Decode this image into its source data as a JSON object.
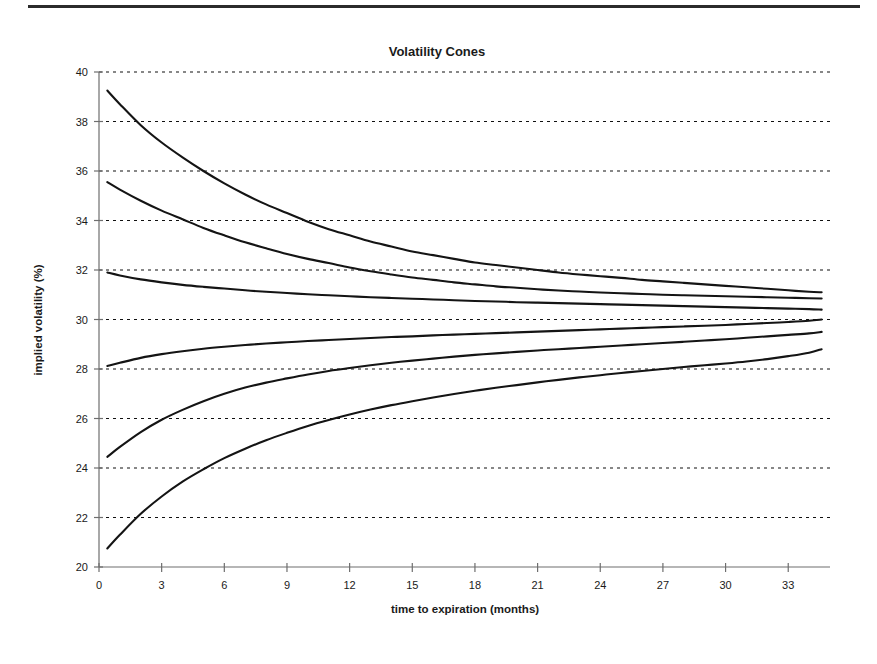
{
  "figure": {
    "title": "Volatility Cones",
    "top_rule": true
  },
  "chart_data": {
    "type": "line",
    "title": "Volatility Cones",
    "xlabel": "time to expiration (months)",
    "ylabel": "implied volatility (%)",
    "xlim": [
      0,
      35
    ],
    "ylim": [
      20,
      40
    ],
    "xticks": [
      0,
      3,
      6,
      9,
      12,
      15,
      18,
      21,
      24,
      27,
      30,
      33
    ],
    "xtick_labels": [
      "0",
      "3",
      "6",
      "9",
      "12",
      "15",
      "18",
      "21",
      "24",
      "27",
      "30",
      "33"
    ],
    "yticks": [
      20,
      22,
      24,
      26,
      28,
      30,
      32,
      34,
      36,
      38,
      40
    ],
    "ytick_labels": [
      "20",
      "22",
      "24",
      "26",
      "28",
      "30",
      "32",
      "34",
      "36",
      "38",
      "40"
    ],
    "grid": "horizontal-dotted",
    "legend": "none",
    "line_color": "#141414",
    "x": [
      0.4,
      1,
      2,
      3,
      4,
      5,
      6,
      7,
      8,
      9,
      10,
      11,
      12,
      13,
      14,
      15,
      16,
      17,
      18,
      19,
      20,
      21,
      22,
      23,
      24,
      25,
      26,
      27,
      28,
      29,
      30,
      31,
      32,
      33,
      34,
      34.6
    ],
    "series": [
      {
        "name": "upper outer band",
        "values": [
          39.25,
          38.7,
          37.85,
          37.15,
          36.55,
          36.0,
          35.5,
          35.05,
          34.65,
          34.3,
          33.95,
          33.65,
          33.4,
          33.15,
          32.95,
          32.75,
          32.6,
          32.45,
          32.3,
          32.2,
          32.1,
          32.0,
          31.9,
          31.82,
          31.75,
          31.68,
          31.6,
          31.54,
          31.48,
          31.42,
          31.36,
          31.3,
          31.24,
          31.18,
          31.12,
          31.1
        ]
      },
      {
        "name": "upper middle band",
        "values": [
          35.55,
          35.25,
          34.8,
          34.4,
          34.05,
          33.7,
          33.4,
          33.12,
          32.88,
          32.65,
          32.45,
          32.28,
          32.1,
          31.95,
          31.82,
          31.7,
          31.6,
          31.5,
          31.42,
          31.34,
          31.28,
          31.22,
          31.17,
          31.13,
          31.09,
          31.06,
          31.03,
          31.0,
          30.98,
          30.96,
          30.94,
          30.92,
          30.9,
          30.88,
          30.86,
          30.85
        ]
      },
      {
        "name": "upper inner band",
        "values": [
          31.9,
          31.78,
          31.62,
          31.5,
          31.4,
          31.32,
          31.25,
          31.18,
          31.12,
          31.07,
          31.02,
          30.98,
          30.94,
          30.9,
          30.87,
          30.84,
          30.81,
          30.78,
          30.75,
          30.73,
          30.7,
          30.68,
          30.66,
          30.64,
          30.62,
          30.6,
          30.58,
          30.56,
          30.54,
          30.52,
          30.5,
          30.48,
          30.46,
          30.44,
          30.42,
          30.4
        ]
      },
      {
        "name": "lower inner band",
        "values": [
          28.12,
          28.25,
          28.45,
          28.6,
          28.72,
          28.82,
          28.9,
          28.97,
          29.03,
          29.08,
          29.13,
          29.17,
          29.21,
          29.25,
          29.29,
          29.32,
          29.36,
          29.39,
          29.42,
          29.45,
          29.48,
          29.51,
          29.54,
          29.57,
          29.6,
          29.63,
          29.66,
          29.69,
          29.72,
          29.75,
          29.78,
          29.82,
          29.86,
          29.9,
          29.95,
          30.0
        ]
      },
      {
        "name": "lower middle band",
        "values": [
          24.45,
          24.85,
          25.45,
          25.95,
          26.35,
          26.7,
          27.0,
          27.25,
          27.45,
          27.62,
          27.78,
          27.92,
          28.04,
          28.15,
          28.25,
          28.34,
          28.42,
          28.5,
          28.57,
          28.63,
          28.69,
          28.75,
          28.8,
          28.85,
          28.9,
          28.95,
          29.0,
          29.05,
          29.1,
          29.15,
          29.2,
          29.26,
          29.32,
          29.38,
          29.44,
          29.5
        ]
      },
      {
        "name": "lower outer band",
        "values": [
          20.75,
          21.3,
          22.15,
          22.85,
          23.45,
          23.95,
          24.4,
          24.78,
          25.12,
          25.42,
          25.7,
          25.94,
          26.16,
          26.36,
          26.54,
          26.7,
          26.85,
          26.99,
          27.12,
          27.24,
          27.35,
          27.46,
          27.56,
          27.66,
          27.75,
          27.84,
          27.92,
          28.0,
          28.08,
          28.15,
          28.22,
          28.3,
          28.4,
          28.52,
          28.66,
          28.8
        ]
      }
    ]
  }
}
